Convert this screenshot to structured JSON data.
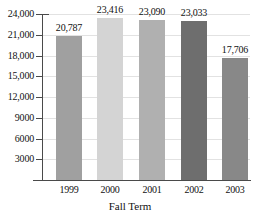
{
  "chart_data": {
    "type": "bar",
    "title": "",
    "xlabel": "Fall Term",
    "ylabel": "",
    "categories": [
      "1999",
      "2000",
      "2001",
      "2002",
      "2003"
    ],
    "values": [
      20787,
      23416,
      23090,
      23033,
      17706
    ],
    "value_labels": [
      "20,787",
      "23,416",
      "23,090",
      "23,033",
      "17,706"
    ],
    "bar_colors": [
      "#a0a0a0",
      "#d4d4d4",
      "#b0b0b0",
      "#6e6e6e",
      "#888888"
    ],
    "ylim": [
      0,
      24000
    ],
    "ytick_values": [
      3000,
      6000,
      9000,
      12000,
      15000,
      18000,
      21000,
      24000
    ],
    "ytick_labels": [
      "3000",
      "6000",
      "9000",
      "12,000",
      "15,000",
      "18,000",
      "21,000",
      "24,000"
    ],
    "grid": true,
    "legend": null
  }
}
